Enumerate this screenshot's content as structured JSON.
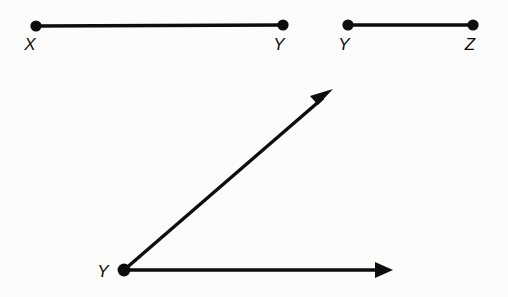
{
  "figure": {
    "background_color": "#fcfcfa",
    "ink_color": "#0d0d0d",
    "width": 508,
    "height": 297,
    "stroke_width": 3.4,
    "dot_radius": 5.6,
    "label_font_size": 17
  },
  "segments": [
    {
      "id": "segment-xy",
      "name": "segment-XY",
      "start_label": "X",
      "end_label": "Z",
      "start_point": {
        "x": 36,
        "y": 26
      },
      "end_point": {
        "x": 283,
        "y": 25
      },
      "start_label_pos": {
        "x": 30,
        "y": 50
      },
      "end_label_pos": {
        "x": 277,
        "y": 50
      },
      "start_label_text": "X",
      "end_label_text": "Y"
    },
    {
      "id": "segment-yz",
      "name": "segment-YZ",
      "start_point": {
        "x": 348,
        "y": 25
      },
      "end_point": {
        "x": 473,
        "y": 25
      },
      "start_label_pos": {
        "x": 342,
        "y": 50
      },
      "end_label_pos": {
        "x": 467,
        "y": 50
      },
      "start_label_text": "Y",
      "end_label_text": "Z"
    }
  ],
  "angle": {
    "id": "angle-y",
    "name": "angle-at-vertex-Y",
    "vertex": {
      "x": 124,
      "y": 270
    },
    "vertex_label_text": "Y",
    "vertex_label_pos": {
      "x": 100,
      "y": 277
    },
    "rays": [
      {
        "id": "ray-diagonal",
        "name": "ray-diagonal-up-right",
        "from": {
          "x": 124,
          "y": 270
        },
        "to": {
          "x": 332,
          "y": 90
        },
        "has_arrowhead": true
      },
      {
        "id": "ray-horizontal",
        "name": "ray-horizontal-right",
        "from": {
          "x": 124,
          "y": 270
        },
        "to": {
          "x": 392,
          "y": 270
        },
        "has_arrowhead": true
      }
    ]
  },
  "labels": {
    "x": "X",
    "y1": "Y",
    "y2": "Y",
    "z": "Z",
    "y_vertex": "Y"
  }
}
